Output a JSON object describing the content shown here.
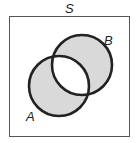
{
  "diagram": {
    "type": "venn",
    "universe_label": "S",
    "sets": [
      {
        "label": "A",
        "cx": 59,
        "cy": 86,
        "r": 30
      },
      {
        "label": "B",
        "cx": 82,
        "cy": 65,
        "r": 30
      }
    ],
    "shaded_region": "symmetric difference (A xor B)",
    "colors": {
      "shade": "#d9d9d9",
      "stroke": "#222222",
      "box": "#555555",
      "background": "#ffffff"
    }
  }
}
